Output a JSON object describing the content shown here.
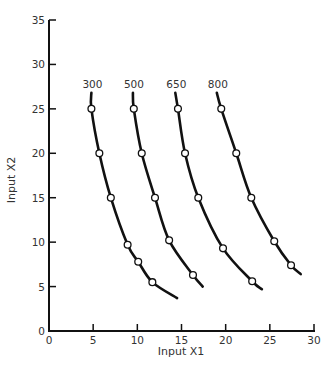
{
  "chart_data": {
    "type": "line",
    "title": "",
    "xlabel": "Input X1",
    "ylabel": "Input X2",
    "xlim": [
      0,
      30
    ],
    "ylim": [
      0,
      35
    ],
    "xticks": [
      0,
      5,
      10,
      15,
      20,
      25,
      30
    ],
    "yticks": [
      0,
      5,
      10,
      15,
      20,
      25,
      30,
      35
    ],
    "grid": false,
    "legend": "none (curves labeled directly at top)",
    "series": [
      {
        "name": "300",
        "curve": [
          [
            4.8,
            26.8
          ],
          [
            4.8,
            25
          ],
          [
            5.7,
            20
          ],
          [
            7.0,
            15
          ],
          [
            8.9,
            9.7
          ],
          [
            10.1,
            7.8
          ],
          [
            11.7,
            5.5
          ],
          [
            14.5,
            3.7
          ]
        ],
        "markers": [
          [
            4.8,
            25
          ],
          [
            5.7,
            20
          ],
          [
            7.0,
            15
          ],
          [
            8.9,
            9.7
          ],
          [
            10.1,
            7.8
          ],
          [
            11.7,
            5.5
          ]
        ]
      },
      {
        "name": "500",
        "curve": [
          [
            9.5,
            26.8
          ],
          [
            9.6,
            25
          ],
          [
            10.5,
            20
          ],
          [
            12.0,
            15
          ],
          [
            13.6,
            10.2
          ],
          [
            16.3,
            6.3
          ],
          [
            17.4,
            5.0
          ]
        ],
        "markers": [
          [
            9.6,
            25
          ],
          [
            10.5,
            20
          ],
          [
            12.0,
            15
          ],
          [
            13.6,
            10.2
          ],
          [
            16.3,
            6.3
          ]
        ]
      },
      {
        "name": "650",
        "curve": [
          [
            14.3,
            26.8
          ],
          [
            14.6,
            25
          ],
          [
            15.4,
            20
          ],
          [
            16.9,
            15
          ],
          [
            19.7,
            9.3
          ],
          [
            23.0,
            5.6
          ],
          [
            24.1,
            4.7
          ]
        ],
        "markers": [
          [
            14.6,
            25
          ],
          [
            15.4,
            20
          ],
          [
            16.9,
            15
          ],
          [
            19.7,
            9.3
          ],
          [
            23.0,
            5.6
          ]
        ]
      },
      {
        "name": "800",
        "curve": [
          [
            19.0,
            26.8
          ],
          [
            19.5,
            25
          ],
          [
            21.2,
            20
          ],
          [
            22.9,
            15
          ],
          [
            25.5,
            10.1
          ],
          [
            27.4,
            7.4
          ],
          [
            28.5,
            6.4
          ]
        ],
        "markers": [
          [
            19.5,
            25
          ],
          [
            21.2,
            20
          ],
          [
            22.9,
            15
          ],
          [
            25.5,
            10.1
          ],
          [
            27.4,
            7.4
          ]
        ]
      }
    ]
  },
  "style": {
    "line_color": "#111111",
    "marker_fill": "#ffffff",
    "text_color": "#333333"
  }
}
